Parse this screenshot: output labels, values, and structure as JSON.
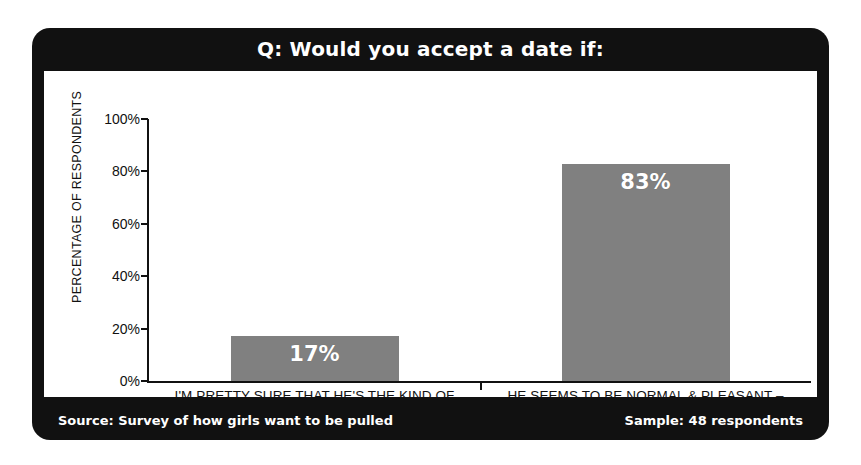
{
  "card": {
    "title": "Q: Would you accept a date if:",
    "footer_source": "Source: Survey of how girls want to be pulled",
    "footer_sample": "Sample: 48 respondents"
  },
  "colors": {
    "band": "#111111",
    "panel": "#ffffff",
    "bar": "#808080",
    "bar_label": "#ffffff",
    "axis": "#111111"
  },
  "chart_data": {
    "type": "bar",
    "title": "Q: Would you accept a date if:",
    "xlabel": "",
    "ylabel": "PERCENTAGE OF RESPONDENTS",
    "categories": [
      "I'M PRETTY SURE THAT HE'S THE KIND OF GUY I COULD FALL IN LOVE WITH",
      "HE SEEMS TO BE NORMAL & PLEASANT – I'LL MAKE MY MIND UP LATER"
    ],
    "category_lines": [
      [
        "I'M PRETTY SURE THAT HE'S THE KIND OF",
        "GUY I COULD FALL IN LOVE WITH"
      ],
      [
        "HE SEEMS TO BE NORMAL & PLEASANT –",
        "I'LL MAKE MY MIND UP LATER"
      ]
    ],
    "values": [
      17,
      83
    ],
    "value_labels": [
      "17%",
      "83%"
    ],
    "ylim": [
      0,
      100
    ],
    "yticks": [
      0,
      20,
      40,
      60,
      80,
      100
    ],
    "ytick_labels": [
      "0%",
      "20%",
      "40%",
      "60%",
      "80%",
      "100%"
    ],
    "grid": false,
    "legend": false,
    "sample_size": 48
  }
}
